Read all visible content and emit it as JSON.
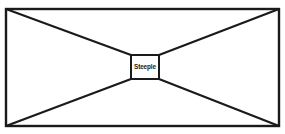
{
  "diagram": {
    "title": "Steeple",
    "center_label": "Steeple",
    "line_color": "#1a1a1a",
    "fill_color": "#ffffff",
    "background_color": "#ffffff",
    "outer_rect": {
      "x": 6,
      "y": 9,
      "width": 273,
      "height": 117
    },
    "inner_rect": {
      "x": 131,
      "y": 55,
      "width": 28,
      "height": 24
    },
    "rays": [
      {
        "name": "top-left-ray",
        "from": [
          6,
          9
        ],
        "to": [
          131,
          55
        ]
      },
      {
        "name": "top-right-ray",
        "from": [
          279,
          9
        ],
        "to": [
          159,
          55
        ]
      },
      {
        "name": "bottom-left-ray",
        "from": [
          6,
          126
        ],
        "to": [
          131,
          79
        ]
      },
      {
        "name": "bottom-right-ray",
        "from": [
          279,
          126
        ],
        "to": [
          159,
          79
        ]
      }
    ]
  }
}
